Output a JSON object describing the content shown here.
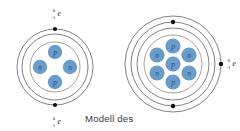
{
  "figure": {
    "background_color": "#ffffff",
    "caption": "Modell des",
    "caption_color": "#3b3b3b",
    "particle_fill": "#6b9bc9",
    "particle_text_color": "#1f4e79",
    "shell_stroke": "#4a4a55",
    "nucleus_stroke": "#8a7a63",
    "electron_dot_color": "#111111"
  },
  "electron_notation": {
    "mass_number": "0",
    "charge_number": "-1",
    "symbol": "e"
  },
  "atoms": [
    {
      "id": "left-atom",
      "name": "helium-atom-model",
      "center": {
        "x": 55,
        "y": 67
      },
      "shell_count": 2,
      "shell_radii": [
        38,
        33
      ],
      "nucleus_radius": 25,
      "proton_count": 2,
      "neutron_count": 2,
      "particles": [
        {
          "label": "p",
          "type": "proton",
          "x": 55,
          "y": 52,
          "r": 7.2
        },
        {
          "label": "n",
          "type": "neutron",
          "x": 40,
          "y": 67,
          "r": 7.2
        },
        {
          "label": "n",
          "type": "neutron",
          "x": 70,
          "y": 67,
          "r": 7.2
        },
        {
          "label": "p",
          "type": "proton",
          "x": 55,
          "y": 82,
          "r": 7.2
        }
      ],
      "electrons": [
        {
          "x": 55,
          "y": 29,
          "r": 2.1,
          "position": "top"
        },
        {
          "x": 55,
          "y": 105,
          "r": 2.1,
          "position": "bottom"
        }
      ],
      "labels": [
        {
          "text": "e",
          "x": 58,
          "y": 13,
          "position": "above-top-electron"
        },
        {
          "text": "e",
          "x": 58,
          "y": 121,
          "position": "below-bottom-electron"
        }
      ]
    },
    {
      "id": "right-atom",
      "name": "lithium-atom-model",
      "center": {
        "x": 173,
        "y": 64
      },
      "shell_count": 3,
      "shell_radii": [
        48,
        42,
        36
      ],
      "nucleus_radius": 29,
      "proton_count": 3,
      "neutron_count": 4,
      "particles": [
        {
          "label": "p",
          "type": "proton",
          "x": 173,
          "y": 46,
          "r": 7.6
        },
        {
          "label": "n",
          "type": "neutron",
          "x": 157,
          "y": 55,
          "r": 7.6
        },
        {
          "label": "n",
          "type": "neutron",
          "x": 189,
          "y": 55,
          "r": 7.6
        },
        {
          "label": "p",
          "type": "proton",
          "x": 173,
          "y": 64,
          "r": 7.6
        },
        {
          "label": "n",
          "type": "neutron",
          "x": 157,
          "y": 73,
          "r": 7.6
        },
        {
          "label": "n",
          "type": "neutron",
          "x": 189,
          "y": 73,
          "r": 7.6
        },
        {
          "label": "p",
          "type": "proton",
          "x": 173,
          "y": 82,
          "r": 7.6
        }
      ],
      "electrons": [
        {
          "x": 173,
          "y": 22,
          "r": 2.2,
          "position": "top-middle-shell"
        },
        {
          "x": 173,
          "y": 106,
          "r": 2.2,
          "position": "bottom-middle-shell"
        },
        {
          "x": 221,
          "y": 64,
          "r": 2.2,
          "position": "right-outer-shell"
        }
      ],
      "labels": [
        {
          "text": "e",
          "x": 229,
          "y": 62,
          "position": "right-of-outer-electron"
        }
      ]
    }
  ]
}
